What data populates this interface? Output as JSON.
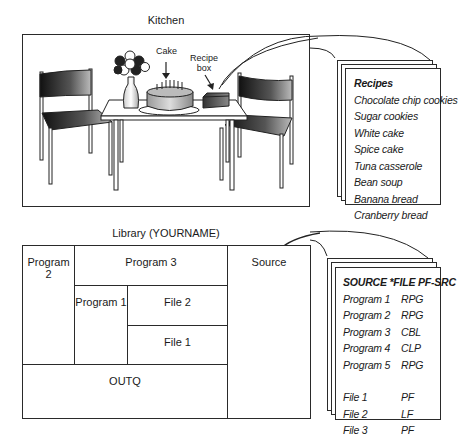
{
  "kitchen": {
    "title": "Kitchen",
    "labels": {
      "cake": "Cake",
      "recipe_box_line1": "Recipe",
      "recipe_box_line2": "box"
    }
  },
  "recipes_card": {
    "heading": "Recipes",
    "items": [
      "Chocolate chip cookies",
      "Sugar cookies",
      "White cake",
      "Spice cake",
      "Tuna casserole",
      "Bean soup",
      "Banana bread",
      "Cranberry bread"
    ]
  },
  "library": {
    "title": "Library (YOURNAME)",
    "cells": {
      "program2": "Program 2",
      "program3": "Program 3",
      "source": "Source",
      "program1": "Program 1",
      "file2": "File 2",
      "file1": "File 1",
      "outq": "OUTQ"
    }
  },
  "source_card": {
    "heading": "SOURCE *FILE PF-SRC",
    "members": [
      {
        "name": "Program 1",
        "type": "RPG"
      },
      {
        "name": "Program 2",
        "type": "RPG"
      },
      {
        "name": "Program 3",
        "type": "CBL"
      },
      {
        "name": "Program 4",
        "type": "CLP"
      },
      {
        "name": "Program 5",
        "type": "RPG"
      }
    ],
    "files": [
      {
        "name": "File 1",
        "type": "PF"
      },
      {
        "name": "File 2",
        "type": "LF"
      },
      {
        "name": "File 3",
        "type": "PF"
      }
    ]
  }
}
